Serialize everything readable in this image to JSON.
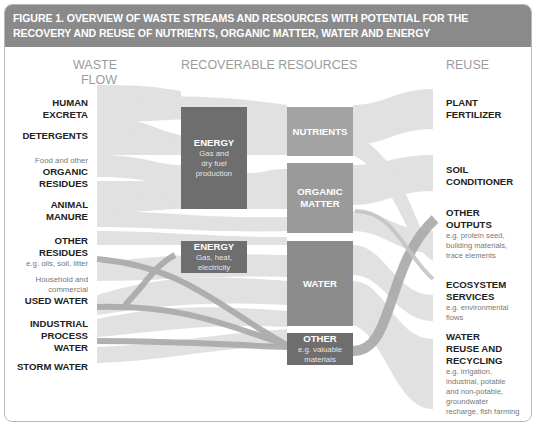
{
  "figure": {
    "title": "FIGURE 1.  OVERVIEW OF WASTE STREAMS AND RESOURCES WITH POTENTIAL FOR THE RECOVERY AND REUSE OF NUTRIENTS, ORGANIC MATTER, WATER AND ENERGY"
  },
  "columns": {
    "left": "WASTE FLOW",
    "left_line1": "WASTE",
    "left_line2": "FLOW",
    "middle": "RECOVERABLE RESOURCES",
    "right": "REUSE"
  },
  "waste_flows": [
    {
      "pre": "",
      "name": "HUMAN EXCRETA",
      "l1": "HUMAN",
      "l2": "EXCRETA",
      "note": ""
    },
    {
      "pre": "",
      "name": "DETERGENTS",
      "l1": "DETERGENTS",
      "l2": "",
      "note": ""
    },
    {
      "pre": "Food and other",
      "name": "ORGANIC RESIDUES",
      "l1": "ORGANIC",
      "l2": "RESIDUES",
      "note": ""
    },
    {
      "pre": "",
      "name": "ANIMAL MANURE",
      "l1": "ANIMAL",
      "l2": "MANURE",
      "note": ""
    },
    {
      "pre": "",
      "name": "OTHER RESIDUES",
      "l1": "OTHER",
      "l2": "RESIDUES",
      "note": "e.g. oils, soil, litter"
    },
    {
      "pre": "Household and commercial",
      "pre1": "Household and",
      "pre2": "commercial",
      "name": "USED WATER",
      "l1": "USED WATER",
      "l2": "",
      "note": ""
    },
    {
      "pre": "",
      "name": "INDUSTRIAL PROCESS WATER",
      "l1": "INDUSTRIAL",
      "l2": "PROCESS",
      "l3": "WATER",
      "note": ""
    },
    {
      "pre": "",
      "name": "STORM WATER",
      "l1": "STORM WATER",
      "l2": "",
      "note": ""
    }
  ],
  "resources": [
    {
      "name": "ENERGY",
      "sub1": "Gas and",
      "sub2": "dry fuel",
      "sub3": "production"
    },
    {
      "name": "NUTRIENTS"
    },
    {
      "name": "ORGANIC",
      "name2": "MATTER"
    },
    {
      "name": "ENERGY",
      "sub1": "Gas, heat,",
      "sub2": "electricity"
    },
    {
      "name": "WATER"
    },
    {
      "name": "OTHER",
      "sub1": "e.g. valuable",
      "sub2": "materials"
    }
  ],
  "reuse": [
    {
      "l1": "PLANT",
      "l2": "FERTILIZER",
      "notes": []
    },
    {
      "l1": "SOIL",
      "l2": "CONDITIONER",
      "notes": []
    },
    {
      "l1": "OTHER",
      "l2": "OUTPUTS",
      "notes": [
        "e.g. protein seed,",
        "building materials,",
        "trace elements"
      ]
    },
    {
      "l1": "ECOSYSTEM",
      "l2": "SERVICES",
      "notes": [
        "e.g. environmental",
        "flows"
      ]
    },
    {
      "l1": "WATER",
      "l2": "REUSE AND",
      "l3": "RECYCLING",
      "notes": [
        "e.g. irrigation,",
        "industrial, potable",
        "and non-potable,",
        "groundwater",
        "recharge, fish farming"
      ]
    }
  ],
  "colors": {
    "header_bg": "#8a8a8a",
    "node_dark": "#6e6e6e",
    "node_mid": "#9a9a9a",
    "flow_light": "#dcdcdc",
    "flow_dark": "#a9a9a9"
  }
}
